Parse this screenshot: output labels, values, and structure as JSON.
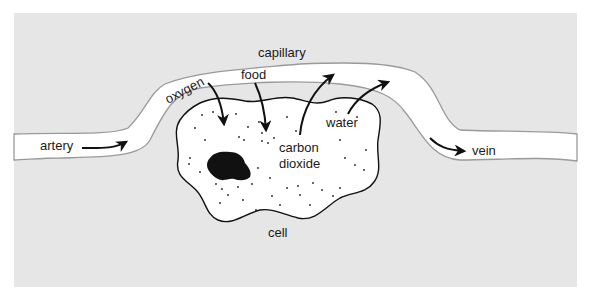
{
  "diagram": {
    "type": "biology-illustration",
    "colors": {
      "background": "#ffffff",
      "tissue": "#e6e6e6",
      "vessel_fill": "#ffffff",
      "vessel_edge": "#9a9a9a",
      "cell_fill": "#ffffff",
      "cell_outline": "#111111",
      "nucleus": "#111111",
      "arrow": "#111111",
      "text": "#1a1a1a"
    },
    "labels": {
      "capillary": "capillary",
      "oxygen": "oxygen",
      "food": "food",
      "water": "water",
      "carbon_line1": "carbon",
      "carbon_line2": "dioxide",
      "artery": "artery",
      "vein": "vein",
      "cell": "cell"
    },
    "arrows": [
      {
        "name": "oxygen-arrow",
        "direction": "into cell"
      },
      {
        "name": "food-arrow",
        "direction": "into cell"
      },
      {
        "name": "carbon-dioxide-arrow",
        "direction": "out of cell"
      },
      {
        "name": "water-arrow",
        "direction": "out of cell"
      },
      {
        "name": "artery-flow-arrow",
        "direction": "into capillary"
      },
      {
        "name": "vein-flow-arrow",
        "direction": "out of capillary"
      }
    ]
  }
}
